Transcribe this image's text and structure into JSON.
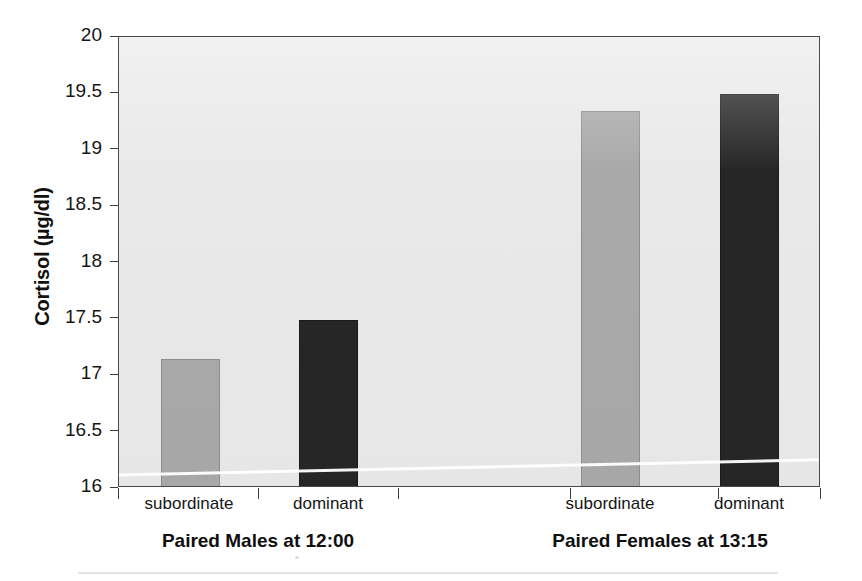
{
  "chart_data": {
    "type": "bar",
    "title": "",
    "xlabel": "",
    "ylabel": "Cortisol (µg/dl)",
    "ylim": [
      16,
      20
    ],
    "yticks": [
      "20",
      "19.5",
      "19",
      "18.5",
      "18",
      "17.5",
      "17",
      "16.5",
      "16"
    ],
    "ytick_values": [
      20,
      19.5,
      19,
      18.5,
      18,
      17.5,
      17,
      16.5,
      16
    ],
    "grid": false,
    "legend": "none",
    "groups": [
      {
        "label": "Paired Males at 12:00"
      },
      {
        "label": "Paired Females at 13:15"
      }
    ],
    "categories": [
      "subordinate",
      "dominant",
      "subordinate",
      "dominant"
    ],
    "values": [
      17.13,
      17.47,
      19.33,
      19.48
    ],
    "bars": [
      {
        "category": "subordinate",
        "group": "Paired Males at 12:00",
        "value": 17.13,
        "style": "light"
      },
      {
        "category": "dominant",
        "group": "Paired Males at 12:00",
        "value": 17.47,
        "style": "dark"
      },
      {
        "category": "subordinate",
        "group": "Paired Females at 13:15",
        "value": 19.33,
        "style": "light"
      },
      {
        "category": "dominant",
        "group": "Paired Females at 13:15",
        "value": 19.48,
        "style": "dark"
      }
    ],
    "colors": {
      "subordinate_bar": "#a9a9a9",
      "dominant_bar": "#262626",
      "plot_background": "#e9e9e9",
      "axis": "#3c3c3c",
      "text": "#161616"
    }
  },
  "layout": {
    "plot": {
      "left": 118,
      "top": 36,
      "width": 702,
      "height": 451
    },
    "bar_geometry": [
      {
        "left": 160,
        "width": 59
      },
      {
        "left": 298,
        "width": 59
      },
      {
        "left": 580,
        "width": 59
      },
      {
        "left": 719,
        "width": 59
      }
    ],
    "xticks": [
      118,
      258,
      398,
      570,
      718,
      820
    ],
    "category_label_centers": [
      189,
      328,
      610,
      749
    ],
    "group_label_centers": [
      258,
      660
    ]
  }
}
